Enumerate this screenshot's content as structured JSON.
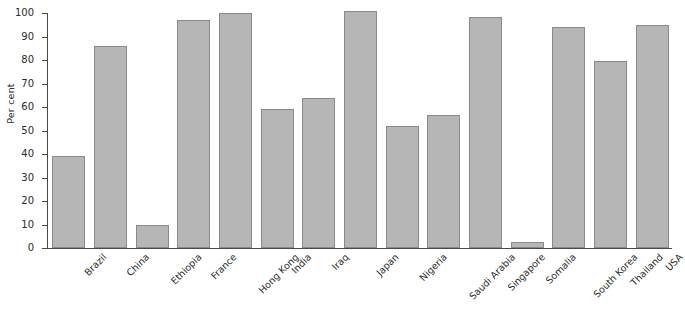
{
  "chart_data": {
    "type": "bar",
    "title": "",
    "xlabel": "",
    "ylabel": "Per cent",
    "ylim": [
      0,
      100
    ],
    "yticks": [
      0,
      10,
      20,
      30,
      40,
      50,
      60,
      70,
      80,
      90,
      100
    ],
    "grid": false,
    "legend": null,
    "orientation": "vertical",
    "bar_color": "#b6b6b6",
    "bar_edge_color": "#8a8a8a",
    "axis_color": "#4a4a4a",
    "categories": [
      "Brazil",
      "China",
      "Ethiopia",
      "France",
      "Hong Kong",
      "India",
      "Iraq",
      "Japan",
      "Nigeria",
      "Saudi Arabia",
      "Singapore",
      "Somalia",
      "South Korea",
      "Thailand",
      "USA"
    ],
    "values": [
      39,
      86,
      10,
      97,
      100,
      59,
      64,
      101,
      52,
      56.5,
      98.5,
      2.5,
      94,
      79.5,
      95
    ]
  },
  "caption": {
    "text": ""
  }
}
